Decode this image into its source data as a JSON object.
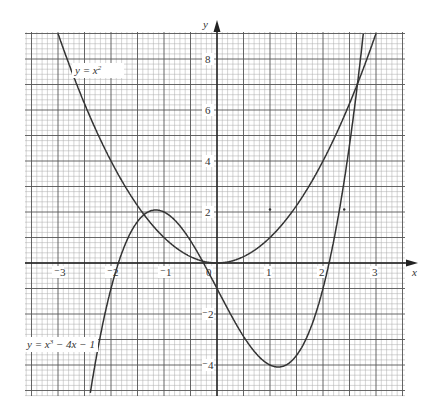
{
  "chart_data": {
    "type": "line",
    "title": "",
    "xlabel": "x",
    "ylabel": "y",
    "xlim": [
      -3.62,
      3.55
    ],
    "ylim": [
      -5.22,
      9.06
    ],
    "grid": true,
    "x_ticks": [
      -3,
      -2,
      -1,
      0,
      1,
      2,
      3
    ],
    "x_tick_labels": [
      "⁻3",
      "⁻2",
      "⁻1",
      "0",
      "1",
      "2",
      "3"
    ],
    "y_ticks": [
      8,
      6,
      4,
      2,
      -2,
      -4
    ],
    "y_tick_labels": [
      "8",
      "6",
      "4",
      "2",
      "⁻2",
      "⁻4"
    ],
    "series": [
      {
        "name": "y = x²",
        "expr": "x^2",
        "x": [
          -3,
          -2,
          -1,
          0,
          1,
          2,
          3
        ],
        "values": [
          9,
          4,
          1,
          0,
          1,
          4,
          9
        ]
      },
      {
        "name": "y = x³ − 4x − 1",
        "expr": "x^3-4x-1",
        "x": [
          -2.3,
          -2,
          -1,
          0,
          1,
          2,
          2.7
        ],
        "values": [
          -3.97,
          -1,
          2,
          -1,
          -4,
          -1,
          7.88
        ]
      }
    ],
    "annotations": [
      {
        "text": "y = x²",
        "near": [
          -2.4,
          7.6
        ]
      },
      {
        "text": "y = x³ − 4x − 1",
        "near": [
          -3.4,
          -3.7
        ]
      },
      {
        "text": "·",
        "at": [
          1.0,
          2.1
        ]
      },
      {
        "text": "·",
        "at": [
          2.4,
          2.1
        ]
      }
    ]
  },
  "labels": {
    "x_axis": "x",
    "y_axis": "y",
    "curve1_prefix": "y = x",
    "curve1_sup": "2",
    "curve2_prefix": "y = x",
    "curve2_sup": "3",
    "curve2_suffix": " − 4x − 1"
  }
}
